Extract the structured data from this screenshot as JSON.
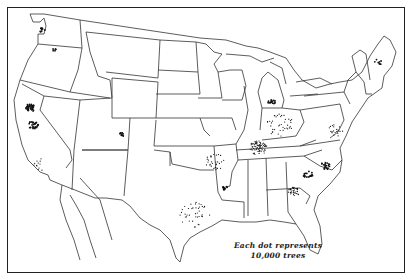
{
  "map": {
    "type": "dot-density",
    "region": "United States",
    "colors": {
      "background": "#ffffff",
      "lines": "#333333",
      "dots": "#111111"
    },
    "legend": {
      "line1": "Each dot represents",
      "line2": "10,000 trees"
    },
    "clusters": [
      {
        "name": "Puget Sound",
        "x": 42,
        "y": 30,
        "r": 3,
        "n": 10
      },
      {
        "name": "Eastern Washington",
        "x": 54,
        "y": 50,
        "r": 2,
        "n": 6
      },
      {
        "name": "Sacramento Valley",
        "x": 30,
        "y": 108,
        "r": 5,
        "n": 40
      },
      {
        "name": "San Joaquin Valley",
        "x": 33,
        "y": 125,
        "r": 5,
        "n": 30
      },
      {
        "name": "Southern California",
        "x": 40,
        "y": 165,
        "r": 8,
        "n": 12
      },
      {
        "name": "Western Colorado",
        "x": 121,
        "y": 135,
        "r": 3,
        "n": 10
      },
      {
        "name": "Missouri / Kansas",
        "x": 215,
        "y": 162,
        "r": 10,
        "n": 30
      },
      {
        "name": "Tennessee / Kentucky",
        "x": 258,
        "y": 148,
        "r": 9,
        "n": 70
      },
      {
        "name": "Central Texas",
        "x": 195,
        "y": 215,
        "r": 16,
        "n": 40
      },
      {
        "name": "Arkansas",
        "x": 225,
        "y": 188,
        "r": 3,
        "n": 10
      },
      {
        "name": "Georgia",
        "x": 294,
        "y": 192,
        "r": 6,
        "n": 35
      },
      {
        "name": "South Carolina",
        "x": 308,
        "y": 175,
        "r": 5,
        "n": 20
      },
      {
        "name": "North Carolina",
        "x": 325,
        "y": 166,
        "r": 5,
        "n": 20
      },
      {
        "name": "Michigan",
        "x": 272,
        "y": 102,
        "r": 4,
        "n": 15
      },
      {
        "name": "Ohio / Indiana",
        "x": 280,
        "y": 125,
        "r": 14,
        "n": 40
      },
      {
        "name": "Virginia / Maryland",
        "x": 335,
        "y": 130,
        "r": 8,
        "n": 20
      },
      {
        "name": "New England",
        "x": 378,
        "y": 62,
        "r": 4,
        "n": 8
      }
    ]
  }
}
